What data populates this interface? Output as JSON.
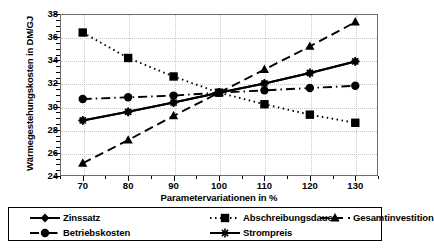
{
  "chart_data": {
    "type": "line",
    "title": "",
    "xlabel": "Parametervariationen in %",
    "ylabel": "Wärmegestehungskosten in DM/GJ",
    "x": [
      70,
      80,
      90,
      100,
      110,
      120,
      130
    ],
    "xlim": [
      65,
      135
    ],
    "ylim": [
      24,
      38
    ],
    "xticks": [
      70,
      80,
      90,
      100,
      110,
      120,
      130
    ],
    "yticks": [
      24,
      26,
      28,
      30,
      32,
      34,
      36,
      38
    ],
    "grid": true,
    "legend_position": "bottom",
    "series": [
      {
        "name": "Zinssatz",
        "marker": "diamond",
        "linestyle": "solid",
        "values": [
          28.8,
          29.55,
          30.35,
          31.2,
          32.0,
          32.9,
          33.9
        ]
      },
      {
        "name": "Abschreibungsdauer",
        "marker": "square",
        "linestyle": "dotted",
        "values": [
          36.4,
          34.2,
          32.6,
          31.2,
          30.2,
          29.3,
          28.6
        ]
      },
      {
        "name": "Gesamtinvestition",
        "marker": "triangle",
        "linestyle": "dashed",
        "values": [
          25.1,
          27.1,
          29.2,
          31.2,
          33.2,
          35.2,
          37.3
        ]
      },
      {
        "name": "Betriebskosten",
        "marker": "circle",
        "linestyle": "dashdot",
        "values": [
          30.65,
          30.8,
          30.95,
          31.2,
          31.4,
          31.6,
          31.8
        ]
      },
      {
        "name": "Strompreis",
        "marker": "star",
        "linestyle": "solid",
        "values": [
          28.8,
          29.55,
          30.35,
          31.2,
          32.0,
          32.9,
          33.9
        ]
      }
    ]
  },
  "legend": {
    "items": [
      {
        "label": "Zinssatz"
      },
      {
        "label": "Abschreibungsdauer"
      },
      {
        "label": "Gesamtinvestition"
      },
      {
        "label": "Betriebskosten"
      },
      {
        "label": "Strompreis"
      }
    ]
  },
  "colors": {
    "ink": "#000000",
    "grid": "#c8c8c8",
    "frame": "#6e6e6e",
    "background": "#ffffff"
  }
}
